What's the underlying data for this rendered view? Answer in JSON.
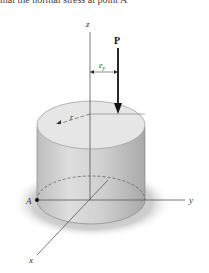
{
  "caption_fragment": "that the normal stress at point A",
  "diagram": {
    "type": "eccentrically loaded cylinder on ground",
    "labels": {
      "z_axis": "z",
      "y_axis": "y",
      "x_axis": "x",
      "load": "P",
      "eccentricity": "e",
      "eccentricity_sub": "y",
      "radius": "r",
      "point": "A"
    },
    "colors": {
      "cylinder_fill": "#d4d4d4",
      "cylinder_top": "#e4e4e4",
      "ground": "#c8c8c8",
      "axis": "#555555",
      "load_arrow": "#111111"
    }
  }
}
